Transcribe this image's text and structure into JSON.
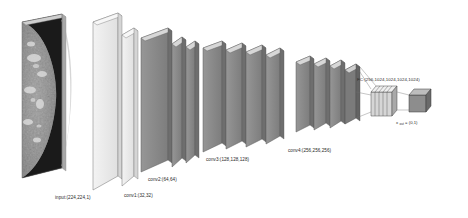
{
  "figure": {
    "type": "cnn-architecture-diagram",
    "background_color": "#ffffff",
    "title": ""
  },
  "input_image": {
    "name": "mammogram-thumbnail",
    "description": "grayscale mammogram slab",
    "label": "input:(224,224,1)",
    "dark_color": "#121212",
    "tissue_color": "#b9b9b9"
  },
  "layers": [
    {
      "id": "conv1",
      "label": "conv1:(32,32)",
      "filters": [
        32,
        32
      ],
      "slab_count": 2,
      "face_color": "#ececec",
      "edge_color": "#6a6a6a"
    },
    {
      "id": "conv2",
      "label": "conv2:(64,64)",
      "filters": [
        64,
        64
      ],
      "slab_count": 2,
      "face_color": "#8c8c8c",
      "edge_color": "#5a5a5a"
    },
    {
      "id": "conv3",
      "label": "conv3:(128,128,128)",
      "filters": [
        128,
        128,
        128
      ],
      "slab_count": 3,
      "face_color": "#8c8c8c",
      "edge_color": "#5a5a5a"
    },
    {
      "id": "conv4",
      "label": "conv4:(256,256,256)",
      "filters": [
        256,
        256,
        256
      ],
      "slab_count": 3,
      "face_color": "#8c8c8c",
      "edge_color": "#5a5a5a"
    }
  ],
  "fc_block": {
    "id": "fc",
    "label": "FC:(256,1024,1024,1024,1024)",
    "units": [
      256,
      1024,
      1024,
      1024,
      1024
    ],
    "slice_count": 5,
    "face_color": "#d0d0d0",
    "edge_color": "#4a4a4a"
  },
  "output_block": {
    "id": "output",
    "label": "x",
    "label_sub": "out",
    "label_rest": " = (0,1)",
    "full_label": "x_out = (0,1)",
    "face_color": "#888888",
    "edge_color": "#3a3a3a"
  },
  "colors": {
    "line": "#7a7a7a",
    "text": "#2a2a2a",
    "light_face": "#ececec",
    "mid_face": "#8c8c8c",
    "dark_face": "#6f6f6f"
  }
}
